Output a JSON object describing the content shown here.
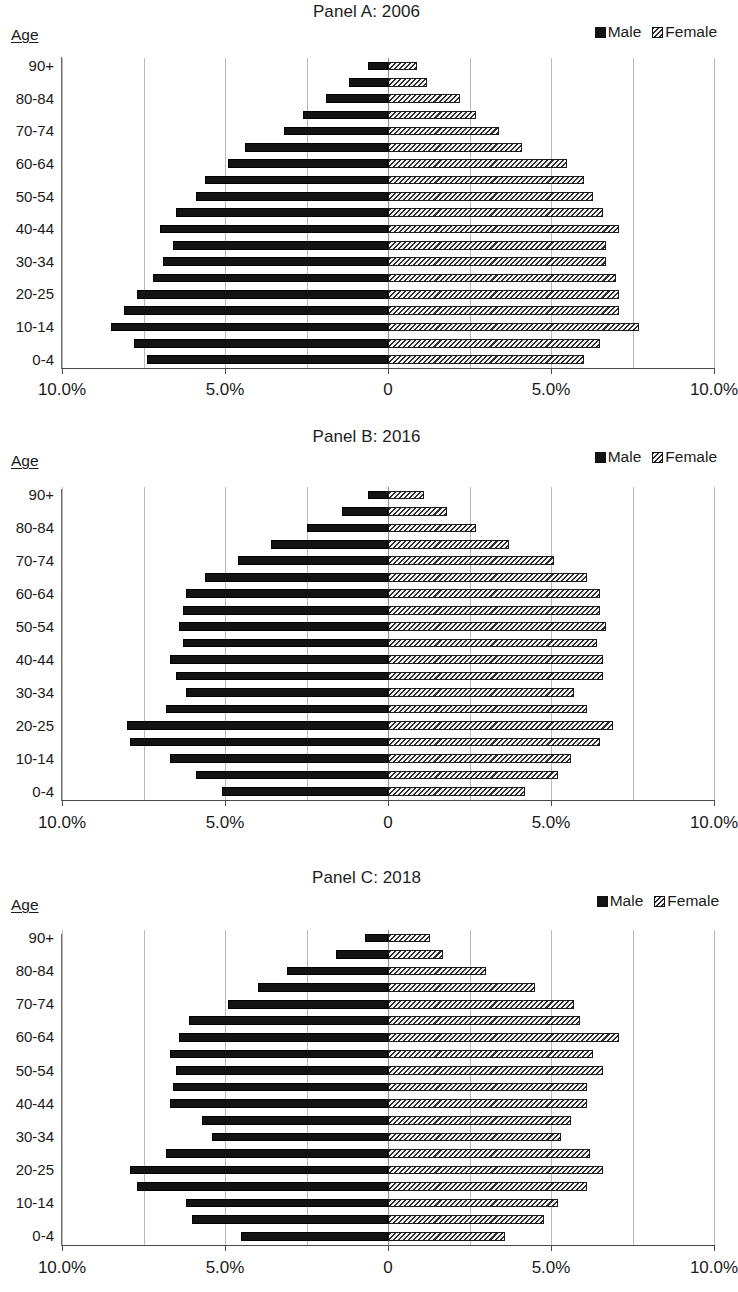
{
  "figure": {
    "age_axis_caption": "Age",
    "legend": {
      "male": "Male",
      "female": "Female"
    },
    "colors": {
      "male": "#131313",
      "female_fill": "#f3f3f3",
      "female_hatch": "#2f2f2f",
      "gridline": "#b9b9b9",
      "axis": "#4a4a4a"
    },
    "x_tick_labels": [
      "10.0%",
      "5.0%",
      "0",
      "5.0%",
      "10.0%"
    ],
    "x_tick_values": [
      -10,
      -5,
      0,
      5,
      10
    ],
    "y_tick_labels": [
      "90+",
      "80-84",
      "70-74",
      "60-64",
      "50-54",
      "40-44",
      "30-34",
      "20-25",
      "10-14",
      "0-4"
    ]
  },
  "chart_data": [
    {
      "type": "bar",
      "title": "Panel A: 2006",
      "subtitle": "",
      "orientation": "horizontal-diverging",
      "xlabel": "",
      "ylabel": "Age",
      "xlim": [
        -10,
        10
      ],
      "grid": true,
      "legend_position": "top-right",
      "categories": [
        "0-4",
        "5-9",
        "10-14",
        "15-19",
        "20-25",
        "25-29",
        "30-34",
        "35-39",
        "40-44",
        "45-49",
        "50-54",
        "55-59",
        "60-64",
        "65-69",
        "70-74",
        "75-79",
        "80-84",
        "85-89",
        "90+"
      ],
      "series": [
        {
          "name": "Male",
          "values": [
            7.4,
            7.8,
            8.5,
            8.1,
            7.7,
            7.2,
            6.9,
            6.6,
            7.0,
            6.5,
            5.9,
            5.6,
            4.9,
            4.4,
            3.2,
            2.6,
            1.9,
            1.2,
            0.6
          ]
        },
        {
          "name": "Female",
          "values": [
            6.0,
            6.5,
            7.7,
            7.1,
            7.1,
            7.0,
            6.7,
            6.7,
            7.1,
            6.6,
            6.3,
            6.0,
            5.5,
            4.1,
            3.4,
            2.7,
            2.2,
            1.2,
            0.9
          ]
        }
      ]
    },
    {
      "type": "bar",
      "title": "Panel B: 2016",
      "subtitle": "",
      "orientation": "horizontal-diverging",
      "xlabel": "",
      "ylabel": "Age",
      "xlim": [
        -10,
        10
      ],
      "grid": true,
      "legend_position": "top-right",
      "categories": [
        "0-4",
        "5-9",
        "10-14",
        "15-19",
        "20-25",
        "25-29",
        "30-34",
        "35-39",
        "40-44",
        "45-49",
        "50-54",
        "55-59",
        "60-64",
        "65-69",
        "70-74",
        "75-79",
        "80-84",
        "85-89",
        "90+"
      ],
      "series": [
        {
          "name": "Male",
          "values": [
            5.1,
            5.9,
            6.7,
            7.9,
            8.0,
            6.8,
            6.2,
            6.5,
            6.7,
            6.3,
            6.4,
            6.3,
            6.2,
            5.6,
            4.6,
            3.6,
            2.5,
            1.4,
            0.6
          ]
        },
        {
          "name": "Female",
          "values": [
            4.2,
            5.2,
            5.6,
            6.5,
            6.9,
            6.1,
            5.7,
            6.6,
            6.6,
            6.4,
            6.7,
            6.5,
            6.5,
            6.1,
            5.1,
            3.7,
            2.7,
            1.8,
            1.1
          ]
        }
      ]
    },
    {
      "type": "bar",
      "title": "Panel C: 2018",
      "subtitle": "",
      "orientation": "horizontal-diverging",
      "xlabel": "",
      "ylabel": "Age",
      "xlim": [
        -10,
        10
      ],
      "grid": true,
      "legend_position": "top-right",
      "categories": [
        "0-4",
        "5-9",
        "10-14",
        "15-19",
        "20-25",
        "25-29",
        "30-34",
        "35-39",
        "40-44",
        "45-49",
        "50-54",
        "55-59",
        "60-64",
        "65-69",
        "70-74",
        "75-79",
        "80-84",
        "85-89",
        "90+"
      ],
      "series": [
        {
          "name": "Male",
          "values": [
            4.5,
            6.0,
            6.2,
            7.7,
            7.9,
            6.8,
            5.4,
            5.7,
            6.7,
            6.6,
            6.5,
            6.7,
            6.4,
            6.1,
            4.9,
            4.0,
            3.1,
            1.6,
            0.7
          ]
        },
        {
          "name": "Female",
          "values": [
            3.6,
            4.8,
            5.2,
            6.1,
            6.6,
            6.2,
            5.3,
            5.6,
            6.1,
            6.1,
            6.6,
            6.3,
            7.1,
            5.9,
            5.7,
            4.5,
            3.0,
            1.7,
            1.3
          ]
        }
      ]
    }
  ]
}
